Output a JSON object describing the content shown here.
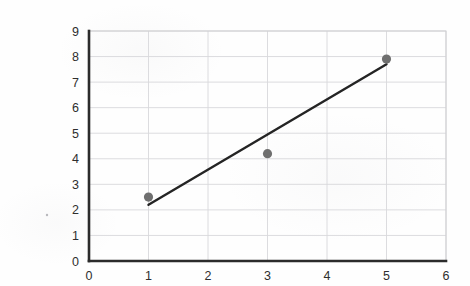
{
  "chart_data": {
    "type": "scatter",
    "title": "",
    "subtitle": "",
    "xlabel": "",
    "ylabel": "",
    "xlim": [
      0,
      6
    ],
    "ylim": [
      0,
      9
    ],
    "x_ticks": [
      0,
      1,
      2,
      3,
      4,
      5,
      6
    ],
    "y_ticks": [
      0,
      1,
      2,
      3,
      4,
      5,
      6,
      7,
      8,
      9
    ],
    "x_tick_labels": [
      "0",
      "1",
      "2",
      "3",
      "4",
      "5",
      "6"
    ],
    "y_tick_labels": [
      "0",
      "1",
      "2",
      "3",
      "4",
      "5",
      "6",
      "7",
      "8",
      "9"
    ],
    "grid": true,
    "legend": false,
    "legend_position": "none",
    "series": [
      {
        "name": "data points",
        "type": "scatter",
        "color": "#6f6f6f",
        "marker": "circle",
        "points": [
          {
            "x": 1,
            "y": 2.5
          },
          {
            "x": 3,
            "y": 4.2
          },
          {
            "x": 5,
            "y": 7.9
          }
        ]
      },
      {
        "name": "trend line",
        "type": "line",
        "color": "#242424",
        "points": [
          {
            "x": 1,
            "y": 2.2
          },
          {
            "x": 5,
            "y": 7.7
          }
        ]
      }
    ]
  },
  "axes": {
    "x_axis_name": "x-axis",
    "y_axis_name": "y-axis"
  }
}
